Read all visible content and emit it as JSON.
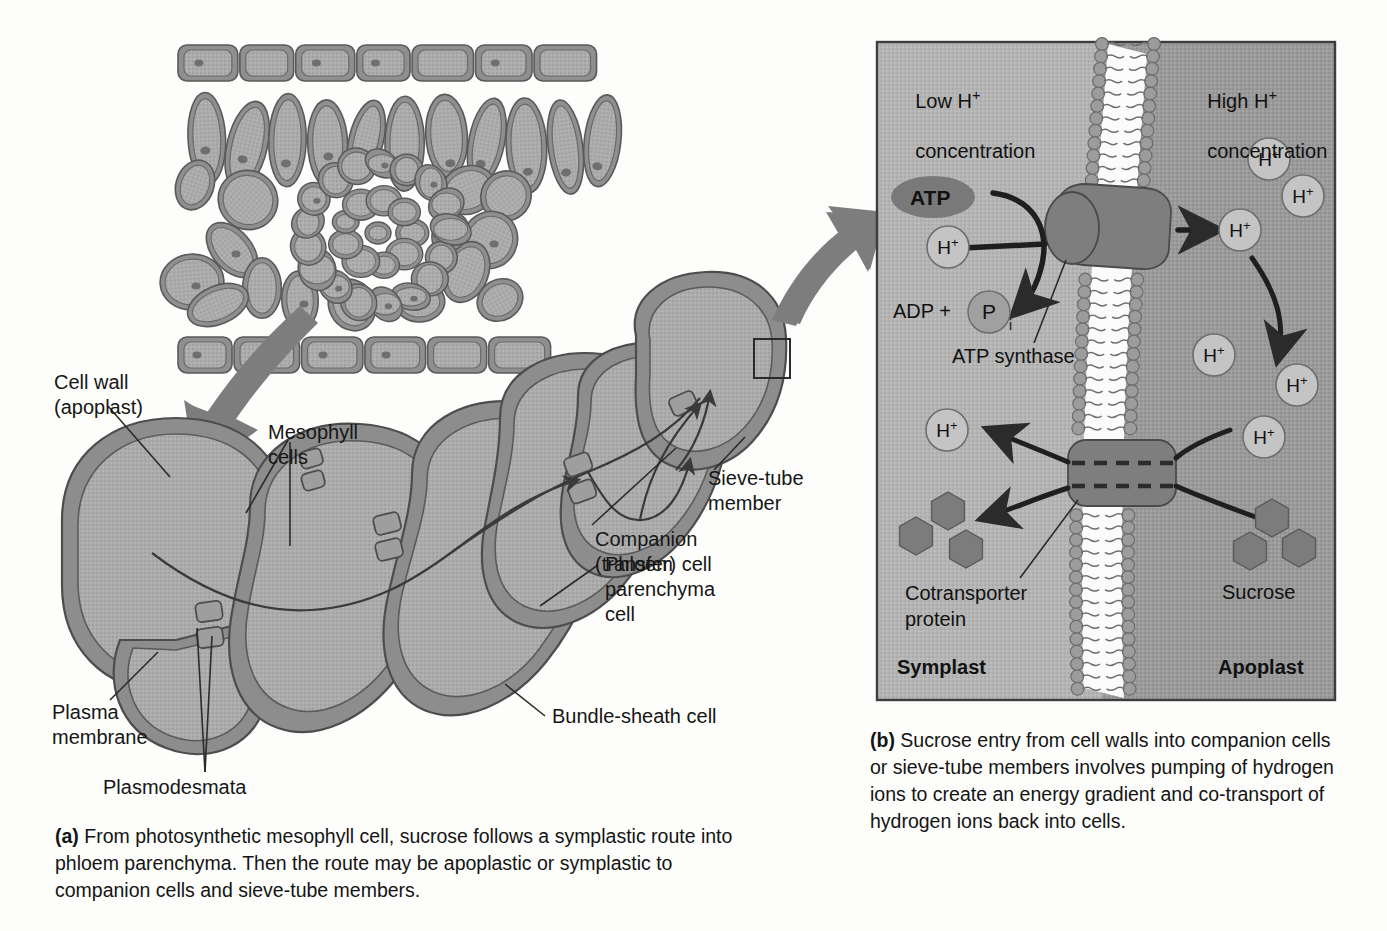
{
  "figure": {
    "type": "biology-diagram"
  },
  "panel_a": {
    "id": "a",
    "labels": [
      {
        "key": "cell_wall",
        "text": "Cell wall\n(apoplast)"
      },
      {
        "key": "mesophyll",
        "text": "Mesophyll\ncells"
      },
      {
        "key": "plasma_membrane",
        "text": "Plasma\nmembrane"
      },
      {
        "key": "plasmodesmata",
        "text": "Plasmodesmata"
      },
      {
        "key": "bundle_sheath",
        "text": "Bundle-sheath cell"
      },
      {
        "key": "phloem_parenchyma",
        "text": "Phloem\nparenchyma\ncell"
      },
      {
        "key": "companion",
        "text": "Companion\n(transfer) cell"
      },
      {
        "key": "sieve_tube",
        "text": "Sieve-tube\nmember"
      }
    ],
    "caption_marker": "(a)",
    "caption": "From photosynthetic mesophyll cell, sucrose follows a symplastic route into phloem parenchyma. Then the route may be apoplastic or symplastic to companion cells and sieve-tube members."
  },
  "panel_b": {
    "id": "b",
    "labels": [
      {
        "key": "low_h",
        "text": "Low H+\nconcentration"
      },
      {
        "key": "high_h",
        "text": "High H+\nconcentration"
      },
      {
        "key": "atp",
        "text": "ATP"
      },
      {
        "key": "adp",
        "text": "ADP +"
      },
      {
        "key": "pi",
        "text": "P"
      },
      {
        "key": "pi_sub",
        "text": "i"
      },
      {
        "key": "atp_synthase",
        "text": "ATP synthase"
      },
      {
        "key": "cotransporter",
        "text": "Cotransporter\nprotein"
      },
      {
        "key": "sucrose",
        "text": "Sucrose"
      },
      {
        "key": "symplast",
        "text": "Symplast"
      },
      {
        "key": "apoplast",
        "text": "Apoplast"
      }
    ],
    "proton_label": "H+",
    "proton_count_right": 6,
    "proton_count_left": 2,
    "sucrose_count_left": 3,
    "sucrose_count_right": 3,
    "caption_marker": "(b)",
    "caption": "Sucrose entry from cell walls into companion cells or sieve-tube members involves pumping of hydrogen ions to create an energy gradient and co-transport of hydrogen ions back into cells."
  },
  "colors": {
    "cytoplasm": "#a9a9a9",
    "cell_wall": "#8f8f8f",
    "outline": "#4a4a4a",
    "panel_bg_left": "#b0b0b0",
    "panel_bg_right": "#a3a3a3",
    "protein": "#8a8a8a",
    "membrane_head": "#9a9a9a",
    "arrow_dark": "#2b2b2b",
    "big_arrow": "#7a7a7a",
    "text": "#141414"
  }
}
